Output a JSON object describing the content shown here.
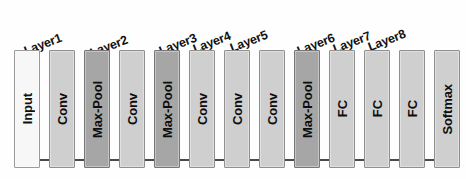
{
  "figure": {
    "background_color": "#fefefe",
    "width": 466,
    "height": 179
  },
  "palette": {
    "input_fill": "#f7f7f7",
    "conv_fill": "#cfcfcf",
    "pool_fill": "#a6a6a6",
    "border": "#8c8c8c",
    "connector": "#4a4a4a",
    "text": "#111111"
  },
  "layer_captions": [
    {
      "label": "Layer1",
      "x": 27,
      "y": 44
    },
    {
      "label": "Layer2",
      "x": 93,
      "y": 46
    },
    {
      "label": "Layer3",
      "x": 162,
      "y": 44
    },
    {
      "label": "Layer4",
      "x": 196,
      "y": 42
    },
    {
      "label": "Layer5",
      "x": 233,
      "y": 41
    },
    {
      "label": "Layer6",
      "x": 300,
      "y": 44
    },
    {
      "label": "Layer7",
      "x": 336,
      "y": 42
    },
    {
      "label": "Layer8",
      "x": 371,
      "y": 40
    }
  ],
  "blocks": [
    {
      "label": "Input",
      "type": "input",
      "fill": "fill-white",
      "x": 14,
      "width": 26
    },
    {
      "label": "Conv",
      "type": "conv",
      "fill": "fill-light",
      "x": 49,
      "width": 26
    },
    {
      "label": "Max-Pool",
      "type": "maxpool",
      "fill": "fill-dark",
      "x": 84,
      "width": 26
    },
    {
      "label": "Conv",
      "type": "conv",
      "fill": "fill-light",
      "x": 119,
      "width": 26
    },
    {
      "label": "Max-Pool",
      "type": "maxpool",
      "fill": "fill-dark",
      "x": 154,
      "width": 26
    },
    {
      "label": "Conv",
      "type": "conv",
      "fill": "fill-light",
      "x": 189,
      "width": 26
    },
    {
      "label": "Conv",
      "type": "conv",
      "fill": "fill-light",
      "x": 224,
      "width": 26
    },
    {
      "label": "Conv",
      "type": "conv",
      "fill": "fill-light",
      "x": 259,
      "width": 26
    },
    {
      "label": "Max-Pool",
      "type": "maxpool",
      "fill": "fill-dark",
      "x": 294,
      "width": 26
    },
    {
      "label": "FC",
      "type": "fc",
      "fill": "fill-light",
      "x": 329,
      "width": 26
    },
    {
      "label": "FC",
      "type": "fc",
      "fill": "fill-light",
      "x": 364,
      "width": 26
    },
    {
      "label": "FC",
      "type": "fc",
      "fill": "fill-light",
      "x": 399,
      "width": 26
    },
    {
      "label": "Softmax",
      "type": "softmax",
      "fill": "fill-light",
      "x": 434,
      "width": 26
    }
  ],
  "connectors": [
    {
      "x": 40,
      "width": 9
    },
    {
      "x": 75,
      "width": 9
    },
    {
      "x": 110,
      "width": 9
    },
    {
      "x": 145,
      "width": 9
    },
    {
      "x": 180,
      "width": 9
    },
    {
      "x": 215,
      "width": 9
    },
    {
      "x": 250,
      "width": 9
    },
    {
      "x": 285,
      "width": 9
    },
    {
      "x": 320,
      "width": 9
    },
    {
      "x": 355,
      "width": 9
    },
    {
      "x": 390,
      "width": 9
    },
    {
      "x": 425,
      "width": 9
    }
  ]
}
